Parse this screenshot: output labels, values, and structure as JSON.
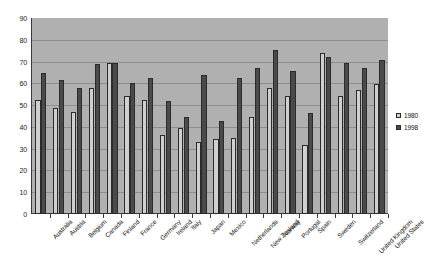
{
  "chart_data": {
    "type": "bar",
    "title": "",
    "subtitle": "",
    "xlabel": "",
    "ylabel": "",
    "ylim": [
      0,
      90
    ],
    "ytick_step": 10,
    "yticks": [
      0,
      10,
      20,
      30,
      40,
      50,
      60,
      70,
      80,
      90
    ],
    "grid": true,
    "legend_position": "right",
    "categories": [
      "Australia",
      "Austria",
      "Belgium",
      "Canada",
      "Finland",
      "France",
      "Germany",
      "Ireland",
      "Italy",
      "Japan",
      "Mexico",
      "Netherlands",
      "New Zealand",
      "Norway",
      "Portugal",
      "Spain",
      "Sweden",
      "Switzerland",
      "United Kingdom",
      "United States"
    ],
    "series": [
      {
        "name": "1980",
        "color": "#cfcfcf",
        "values": [
          52.5,
          48.7,
          47.0,
          57.7,
          69.2,
          54.0,
          52.2,
          36.2,
          39.6,
          33.0,
          34.5,
          35.0,
          44.5,
          58.0,
          54.0,
          31.5,
          74.0,
          54.0,
          57.0,
          59.7
        ]
      },
      {
        "name": "1998",
        "color": "#4a4a4a",
        "values": [
          64.6,
          61.7,
          57.7,
          69.0,
          69.5,
          60.0,
          62.5,
          52.0,
          44.7,
          63.7,
          42.5,
          62.3,
          67.0,
          75.5,
          65.5,
          46.5,
          72.0,
          69.3,
          67.0,
          70.5
        ]
      }
    ]
  },
  "legend": {
    "entries": [
      {
        "label": "1980"
      },
      {
        "label": "1998"
      }
    ]
  },
  "colors": {
    "plot_background": "#b0b0b0",
    "gridline": "#8e8e8e",
    "axis": "#3a3a3a",
    "series_1980": "#cfcfcf",
    "series_1998": "#4a4a4a",
    "page_background": "#ffffff"
  }
}
